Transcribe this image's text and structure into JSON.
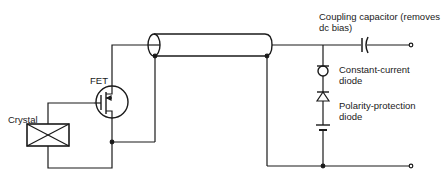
{
  "diagram": {
    "labels": {
      "crystal": "Crystal",
      "fet": "FET",
      "coupling_line1": "Coupling capacitor (removes",
      "coupling_line2": "dc bias)",
      "ccd_line1": "Constant-current",
      "ccd_line2": "diode",
      "ppd_line1": "Polarity-protection",
      "ppd_line2": "diode"
    },
    "components": [
      "crystal",
      "fet",
      "coaxial-cable",
      "coupling-capacitor",
      "constant-current-diode",
      "polarity-protection-diode",
      "power-supply",
      "output-terminals"
    ],
    "colors": {
      "line": "#1a1a1a",
      "background": "#ffffff"
    }
  }
}
